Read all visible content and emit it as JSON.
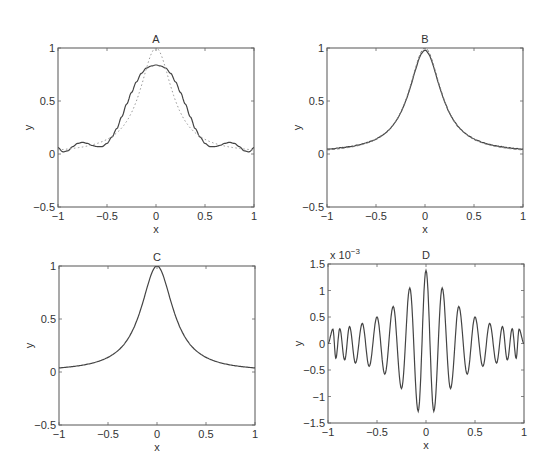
{
  "figure": {
    "width": 552,
    "height": 471,
    "line_color": "#444444",
    "secondary_line_color": "#999999"
  },
  "chart_data": [
    {
      "id": "A",
      "type": "line",
      "title": "A",
      "xlabel": "x",
      "ylabel": "y",
      "xlim": [
        -1,
        1
      ],
      "ylim": [
        -0.5,
        1
      ],
      "xticks": [
        -1,
        -0.5,
        0,
        0.5,
        1
      ],
      "xtick_labels": [
        "−1",
        "−0.5",
        "0",
        "0.5",
        "1"
      ],
      "yticks": [
        -0.5,
        0,
        0.5,
        1
      ],
      "ytick_labels": [
        "−0.5",
        "0",
        "0.5",
        "1"
      ],
      "grid": false,
      "box": [
        58,
        48,
        254,
        207
      ],
      "series": [
        {
          "name": "approximation",
          "style": "solid",
          "x": [
            -1,
            -0.95,
            -0.9,
            -0.85,
            -0.8,
            -0.75,
            -0.7,
            -0.65,
            -0.6,
            -0.55,
            -0.5,
            -0.45,
            -0.4,
            -0.35,
            -0.3,
            -0.25,
            -0.2,
            -0.15,
            -0.1,
            -0.05,
            0,
            0.05,
            0.1,
            0.15,
            0.2,
            0.25,
            0.3,
            0.35,
            0.4,
            0.45,
            0.5,
            0.55,
            0.6,
            0.65,
            0.7,
            0.75,
            0.8,
            0.85,
            0.9,
            0.95,
            1
          ],
          "values": [
            0.06,
            0.02,
            0.03,
            0.07,
            0.1,
            0.11,
            0.1,
            0.08,
            0.07,
            0.07,
            0.1,
            0.16,
            0.24,
            0.35,
            0.47,
            0.58,
            0.68,
            0.76,
            0.81,
            0.83,
            0.84,
            0.83,
            0.81,
            0.76,
            0.68,
            0.58,
            0.47,
            0.35,
            0.24,
            0.16,
            0.1,
            0.07,
            0.07,
            0.08,
            0.1,
            0.11,
            0.1,
            0.07,
            0.03,
            0.02,
            0.06
          ]
        },
        {
          "name": "runge function",
          "style": "dotted",
          "function": "1/(1+25x^2)"
        }
      ]
    },
    {
      "id": "B",
      "type": "line",
      "title": "B",
      "xlabel": "x",
      "ylabel": "y",
      "xlim": [
        -1,
        1
      ],
      "ylim": [
        -0.5,
        1
      ],
      "xticks": [
        -1,
        -0.5,
        0,
        0.5,
        1
      ],
      "xtick_labels": [
        "−1",
        "−0.5",
        "0",
        "0.5",
        "1"
      ],
      "yticks": [
        -0.5,
        0,
        0.5,
        1
      ],
      "ytick_labels": [
        "−0.5",
        "0",
        "0.5",
        "1"
      ],
      "grid": false,
      "box": [
        327,
        48,
        523,
        207
      ],
      "series": [
        {
          "name": "noisy approximation",
          "style": "solid",
          "function": "0.97/(1+25x^2) with small noise",
          "peak": 0.97
        },
        {
          "name": "runge function",
          "style": "dashed",
          "function": "1/(1+25x^2)"
        }
      ]
    },
    {
      "id": "C",
      "type": "line",
      "title": "C",
      "xlabel": "x",
      "ylabel": "y",
      "xlim": [
        -1,
        1
      ],
      "ylim": [
        -0.5,
        1
      ],
      "xticks": [
        -1,
        -0.5,
        0,
        0.5,
        1
      ],
      "xtick_labels": [
        "−1",
        "−0.5",
        "0",
        "0.5",
        "1"
      ],
      "yticks": [
        -0.5,
        0,
        0.5,
        1
      ],
      "ytick_labels": [
        "−0.5",
        "0",
        "0.5",
        "1"
      ],
      "grid": false,
      "box": [
        59,
        266,
        255,
        425
      ],
      "series": [
        {
          "name": "runge function",
          "style": "solid",
          "function": "1/(1+25x^2)",
          "x": [
            -1,
            -0.75,
            -0.5,
            -0.25,
            0,
            0.25,
            0.5,
            0.75,
            1
          ],
          "values": [
            0.038,
            0.066,
            0.138,
            0.39,
            1.0,
            0.39,
            0.138,
            0.066,
            0.038
          ]
        }
      ]
    },
    {
      "id": "D",
      "type": "line",
      "title": "D",
      "xlabel": "x",
      "ylabel": "y",
      "y_scale_label": "x 10",
      "y_scale_exponent": "−3",
      "xlim": [
        -1,
        1
      ],
      "ylim": [
        -1.5,
        1.5
      ],
      "xticks": [
        -1,
        -0.5,
        0,
        0.5,
        1
      ],
      "xtick_labels": [
        "−1",
        "−0.5",
        "0",
        "0.5",
        "1"
      ],
      "yticks": [
        -1.5,
        -1,
        -0.5,
        0,
        0.5,
        1,
        1.5
      ],
      "ytick_labels": [
        "−1.5",
        "−1",
        "−0.5",
        "0",
        "0.5",
        "1",
        "1.5"
      ],
      "grid": false,
      "box": [
        328,
        264,
        524,
        423
      ],
      "series": [
        {
          "name": "error (x 10^-3)",
          "style": "solid",
          "peaks_x": [
            0,
            -0.165,
            0.165,
            -0.335,
            0.335,
            -0.5,
            0.5,
            -0.65,
            0.65,
            -0.78,
            0.78,
            -0.88,
            0.88,
            -0.95,
            0.95
          ],
          "peaks_y": [
            1.38,
            1.05,
            1.05,
            0.7,
            0.7,
            0.5,
            0.5,
            0.38,
            0.38,
            0.32,
            0.32,
            0.28,
            0.28,
            0.27,
            0.27
          ],
          "troughs_x": [
            -0.08,
            0.08,
            -0.25,
            0.25,
            -0.42,
            0.42,
            -0.58,
            0.58,
            -0.72,
            0.72,
            -0.83,
            0.83,
            -0.92,
            0.92
          ],
          "troughs_y": [
            -1.28,
            -1.28,
            -0.85,
            -0.85,
            -0.58,
            -0.58,
            -0.43,
            -0.43,
            -0.37,
            -0.37,
            -0.31,
            -0.31,
            -0.28,
            -0.28
          ]
        }
      ]
    }
  ]
}
